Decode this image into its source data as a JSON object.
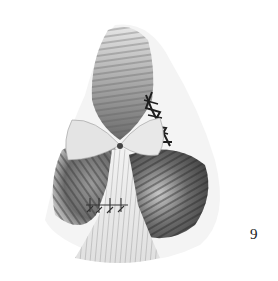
{
  "figure": {
    "number": "9"
  },
  "colors": {
    "background": "#ffffff",
    "ink_dark": "#2a2a2a",
    "ink_mid": "#7a7a7a",
    "ink_light": "#cfcfcf"
  }
}
